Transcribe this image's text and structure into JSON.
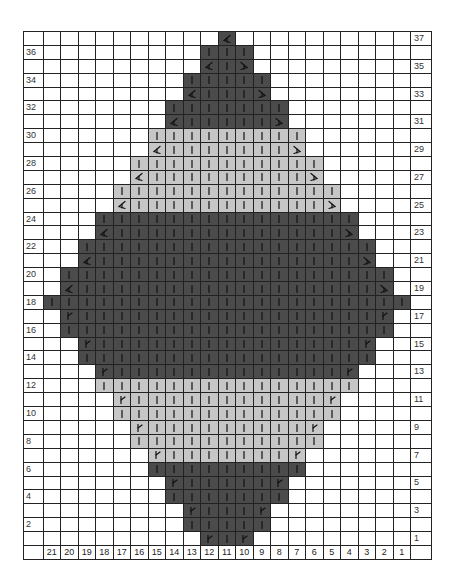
{
  "chart": {
    "columns": 21,
    "rows_total": 37,
    "column_numbers": [
      21,
      20,
      19,
      18,
      17,
      16,
      15,
      14,
      13,
      12,
      11,
      10,
      9,
      8,
      7,
      6,
      5,
      4,
      3,
      2,
      1
    ],
    "colors": {
      "dark": "#4b4b4b",
      "light": "#c6c6c6",
      "empty": "#ffffff",
      "grid": "#222222"
    },
    "symbols": {
      "knit": "vertical-bar",
      "dec_left": "left-decrease",
      "dec_right": "right-decrease",
      "inc": "increase"
    },
    "rows": [
      {
        "row": 37,
        "from": 11,
        "to": 11,
        "color": "dark",
        "edge": "dec_left_single"
      },
      {
        "row": 36,
        "from": 12,
        "to": 10,
        "color": "dark",
        "edge": "knit"
      },
      {
        "row": 35,
        "from": 12,
        "to": 10,
        "color": "dark",
        "edge": "dec"
      },
      {
        "row": 34,
        "from": 13,
        "to": 9,
        "color": "dark",
        "edge": "knit"
      },
      {
        "row": 33,
        "from": 13,
        "to": 9,
        "color": "dark",
        "edge": "dec"
      },
      {
        "row": 32,
        "from": 14,
        "to": 8,
        "color": "dark",
        "edge": "knit"
      },
      {
        "row": 31,
        "from": 14,
        "to": 8,
        "color": "dark",
        "edge": "dec"
      },
      {
        "row": 30,
        "from": 15,
        "to": 7,
        "color": "light",
        "edge": "knit"
      },
      {
        "row": 29,
        "from": 15,
        "to": 7,
        "color": "light",
        "edge": "dec"
      },
      {
        "row": 28,
        "from": 16,
        "to": 6,
        "color": "light",
        "edge": "knit"
      },
      {
        "row": 27,
        "from": 16,
        "to": 6,
        "color": "light",
        "edge": "dec"
      },
      {
        "row": 26,
        "from": 17,
        "to": 5,
        "color": "light",
        "edge": "knit"
      },
      {
        "row": 25,
        "from": 17,
        "to": 5,
        "color": "light",
        "edge": "dec"
      },
      {
        "row": 24,
        "from": 18,
        "to": 4,
        "color": "dark",
        "edge": "knit"
      },
      {
        "row": 23,
        "from": 18,
        "to": 4,
        "color": "dark",
        "edge": "dec"
      },
      {
        "row": 22,
        "from": 19,
        "to": 3,
        "color": "dark",
        "edge": "knit"
      },
      {
        "row": 21,
        "from": 19,
        "to": 3,
        "color": "dark",
        "edge": "dec"
      },
      {
        "row": 20,
        "from": 20,
        "to": 2,
        "color": "dark",
        "edge": "knit"
      },
      {
        "row": 19,
        "from": 20,
        "to": 2,
        "color": "dark",
        "edge": "dec"
      },
      {
        "row": 18,
        "from": 21,
        "to": 1,
        "color": "dark",
        "edge": "knit"
      },
      {
        "row": 17,
        "from": 20,
        "to": 2,
        "color": "dark",
        "edge": "inc"
      },
      {
        "row": 16,
        "from": 20,
        "to": 2,
        "color": "dark",
        "edge": "knit"
      },
      {
        "row": 15,
        "from": 19,
        "to": 3,
        "color": "dark",
        "edge": "inc"
      },
      {
        "row": 14,
        "from": 19,
        "to": 3,
        "color": "dark",
        "edge": "knit"
      },
      {
        "row": 13,
        "from": 18,
        "to": 4,
        "color": "dark",
        "edge": "inc"
      },
      {
        "row": 12,
        "from": 18,
        "to": 4,
        "color": "light",
        "edge": "knit"
      },
      {
        "row": 11,
        "from": 17,
        "to": 5,
        "color": "light",
        "edge": "inc"
      },
      {
        "row": 10,
        "from": 17,
        "to": 5,
        "color": "light",
        "edge": "knit"
      },
      {
        "row": 9,
        "from": 16,
        "to": 6,
        "color": "light",
        "edge": "inc"
      },
      {
        "row": 8,
        "from": 16,
        "to": 6,
        "color": "light",
        "edge": "knit"
      },
      {
        "row": 7,
        "from": 15,
        "to": 7,
        "color": "light",
        "edge": "inc"
      },
      {
        "row": 6,
        "from": 15,
        "to": 7,
        "color": "dark",
        "edge": "knit"
      },
      {
        "row": 5,
        "from": 14,
        "to": 8,
        "color": "dark",
        "edge": "inc"
      },
      {
        "row": 4,
        "from": 14,
        "to": 8,
        "color": "dark",
        "edge": "knit"
      },
      {
        "row": 3,
        "from": 13,
        "to": 9,
        "color": "dark",
        "edge": "inc"
      },
      {
        "row": 2,
        "from": 13,
        "to": 9,
        "color": "dark",
        "edge": "knit"
      },
      {
        "row": 1,
        "from": 12,
        "to": 10,
        "color": "dark",
        "edge": "inc"
      }
    ]
  }
}
